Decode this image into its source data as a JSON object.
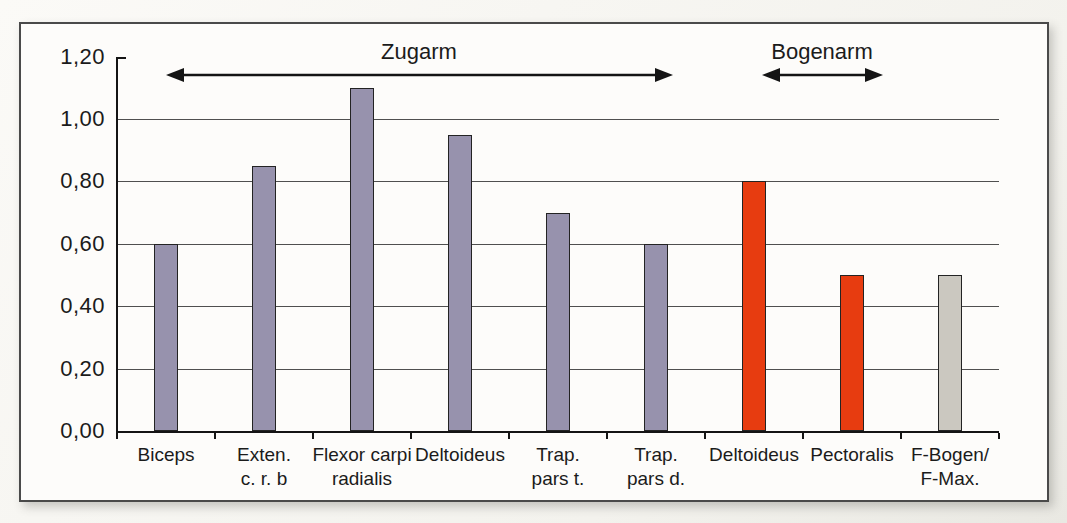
{
  "chart_data": {
    "type": "bar",
    "title": "",
    "xlabel": "",
    "ylabel": "",
    "ylim": [
      0,
      1.2
    ],
    "yticks": [
      0,
      0.2,
      0.4,
      0.6,
      0.8,
      1.0,
      1.2
    ],
    "ytick_labels": [
      "0,00",
      "0,20",
      "0,40",
      "0,60",
      "0,80",
      "1,00",
      "1,20"
    ],
    "grid": "horizontal",
    "legend": "none",
    "categories": [
      {
        "label_lines": [
          "Biceps"
        ],
        "value": 0.6,
        "group": "zugarm"
      },
      {
        "label_lines": [
          "Exten.",
          "c. r. b"
        ],
        "value": 0.85,
        "group": "zugarm"
      },
      {
        "label_lines": [
          "Flexor carpi",
          "radialis"
        ],
        "value": 1.1,
        "group": "zugarm"
      },
      {
        "label_lines": [
          "Deltoideus"
        ],
        "value": 0.95,
        "group": "zugarm"
      },
      {
        "label_lines": [
          "Trap.",
          "pars t."
        ],
        "value": 0.7,
        "group": "zugarm"
      },
      {
        "label_lines": [
          "Trap.",
          "pars d."
        ],
        "value": 0.6,
        "group": "zugarm"
      },
      {
        "label_lines": [
          "Deltoideus"
        ],
        "value": 0.8,
        "group": "bogenarm"
      },
      {
        "label_lines": [
          "Pectoralis"
        ],
        "value": 0.5,
        "group": "bogenarm"
      },
      {
        "label_lines": [
          "F-Bogen/",
          "F-Max."
        ],
        "value": 0.5,
        "group": "reference"
      }
    ],
    "group_colors": {
      "zugarm": "#9792ad",
      "bogenarm": "#e73c10",
      "reference": "#cbc8c0"
    },
    "bar_border_color": "#232323",
    "annotations": [
      {
        "label": "Zugarm",
        "from_cat": 0.0,
        "to_cat": 5.17
      },
      {
        "label": "Bogenarm",
        "from_cat": 6.08,
        "to_cat": 7.31
      }
    ]
  }
}
